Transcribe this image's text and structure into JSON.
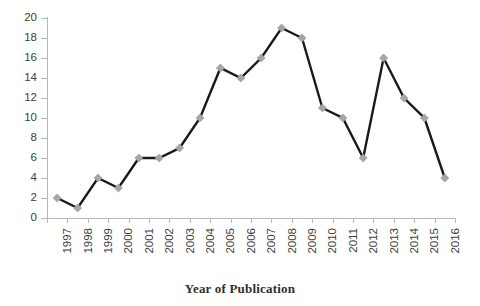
{
  "chart_data": {
    "type": "line",
    "title": "",
    "xlabel": "Year of Publication",
    "ylabel": "",
    "categories": [
      "1997",
      "1998",
      "1999",
      "2000",
      "2001",
      "2002",
      "2003",
      "2004",
      "2005",
      "2006",
      "2007",
      "2008",
      "2009",
      "2010",
      "2011",
      "2012",
      "2013",
      "2014",
      "2015",
      "2016"
    ],
    "values": [
      2,
      1,
      4,
      3,
      6,
      6,
      7,
      10,
      15,
      14,
      16,
      19,
      18,
      11,
      10,
      6,
      16,
      12,
      10,
      4
    ],
    "series": [
      {
        "name": "Publications",
        "values": [
          2,
          1,
          4,
          3,
          6,
          6,
          7,
          10,
          15,
          14,
          16,
          19,
          18,
          11,
          10,
          6,
          16,
          12,
          10,
          4
        ]
      }
    ],
    "ylim": [
      0,
      20
    ],
    "ytick_labels": [
      "20",
      "18",
      "16",
      "14",
      "12",
      "10",
      "8",
      "6",
      "4",
      "2",
      "0"
    ],
    "ytick_values": [
      20,
      18,
      16,
      14,
      12,
      10,
      8,
      6,
      4,
      2,
      0
    ],
    "ytick_step": 2,
    "grid": false,
    "legend": false,
    "legend_position": "none",
    "marker": "diamond",
    "colors": {
      "line": "#1a1a1a",
      "marker_fill": "#a6a6a6",
      "axis": "#b8b8b8",
      "text": "#404040",
      "title_text": "#2f2f2f",
      "background": "#ffffff"
    },
    "annotations": []
  }
}
